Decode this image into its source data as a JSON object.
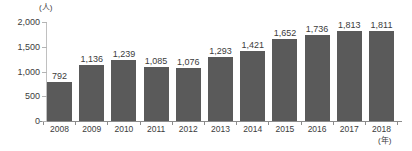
{
  "chart_data": {
    "type": "bar",
    "title": "",
    "xlabel": "(年)",
    "ylabel": "(人)",
    "categories": [
      "2008",
      "2009",
      "2010",
      "2011",
      "2012",
      "2013",
      "2014",
      "2015",
      "2016",
      "2017",
      "2018"
    ],
    "values": [
      792,
      1136,
      1239,
      1085,
      1076,
      1293,
      1421,
      1652,
      1736,
      1813,
      1811
    ],
    "value_labels": [
      "792",
      "1,136",
      "1,239",
      "1,085",
      "1,076",
      "1,293",
      "1,421",
      "1,652",
      "1,736",
      "1,813",
      "1,811"
    ],
    "ylim": [
      0,
      2000
    ],
    "yticks": [
      0,
      500,
      1000,
      1500,
      2000
    ],
    "ytick_labels": [
      "0",
      "500",
      "1,000",
      "1,500",
      "2,000"
    ],
    "grid": false,
    "legend": null,
    "bar_color": "#5a5a5a",
    "axis_color": "#8c8c8c",
    "text_color": "#3c3c3c",
    "background": "#ffffff"
  }
}
